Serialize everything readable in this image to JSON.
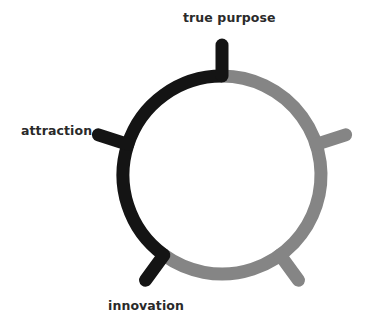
{
  "diagram": {
    "type": "cycle-circle",
    "labels": {
      "top": "true purpose",
      "left": "attraction",
      "bottom_left": "innovation"
    },
    "colors": {
      "active": "#141414",
      "inactive": "#858585",
      "text": "#2a2a2a",
      "background": "#ffffff"
    },
    "geometry": {
      "center_x": 222,
      "center_y": 175,
      "radius": 99,
      "stroke_width": 13,
      "tick_outer_radius": 130,
      "spoke_count": 5
    },
    "segments": [
      {
        "name": "active-arc",
        "from_spoke": "bottom-left",
        "to_spoke": "top",
        "color": "active"
      },
      {
        "name": "inactive-arc",
        "from_spoke": "top",
        "to_spoke": "bottom-left",
        "color": "inactive"
      }
    ],
    "spokes": [
      {
        "position": "top",
        "angle_deg": -90,
        "color": "active",
        "label": "true purpose"
      },
      {
        "position": "right",
        "angle_deg": -18,
        "color": "inactive",
        "label": ""
      },
      {
        "position": "bottom-right",
        "angle_deg": 54,
        "color": "inactive",
        "label": ""
      },
      {
        "position": "bottom-left",
        "angle_deg": 126,
        "color": "active",
        "label": "innovation"
      },
      {
        "position": "left",
        "angle_deg": 198,
        "color": "active",
        "label": "attraction"
      }
    ]
  }
}
